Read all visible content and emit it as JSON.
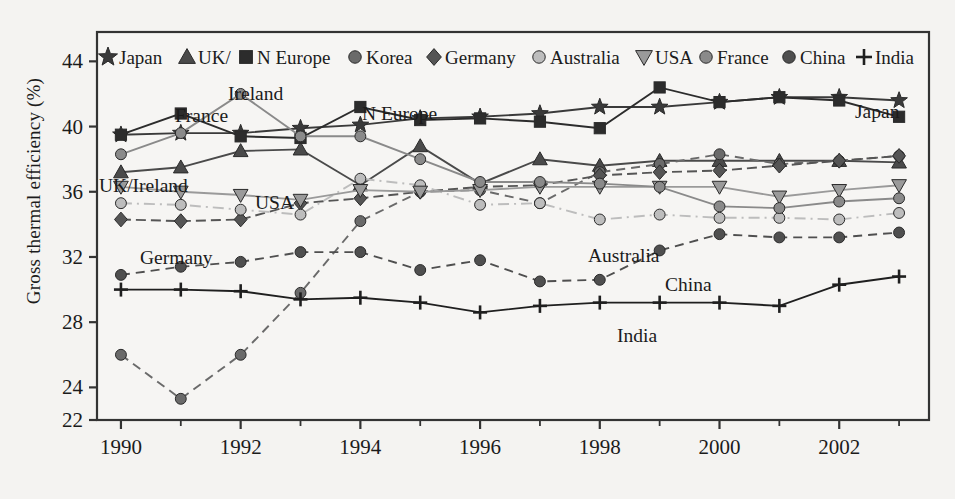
{
  "figure": {
    "background_color": "#f4f3f1",
    "axis_color": "#333333",
    "plot_area": {
      "x": 97,
      "y": 32,
      "width": 832,
      "height": 388
    }
  },
  "chart_data": {
    "type": "line",
    "title": "",
    "xlabel": "",
    "ylabel": "Gross thermal efficiency (%)",
    "x": [
      1990,
      1991,
      1992,
      1993,
      1994,
      1995,
      1996,
      1997,
      1998,
      1999,
      2000,
      2001,
      2002,
      2003
    ],
    "xlim": [
      1989.6,
      2003.5
    ],
    "ylim": [
      22,
      45.8
    ],
    "xticks": [
      1990,
      1992,
      1994,
      1996,
      1998,
      2000,
      2002
    ],
    "xtick_labels": [
      "1990",
      "1992",
      "1994",
      "1996",
      "1998",
      "2000",
      "2002"
    ],
    "xminor_ticks": [
      1991,
      1993,
      1995,
      1997,
      1999,
      2001,
      2003
    ],
    "yticks": [
      22,
      24,
      28,
      32,
      36,
      40,
      44
    ],
    "ytick_labels": [
      "22",
      "24",
      "28",
      "32",
      "36",
      "40",
      "44"
    ],
    "grid": false,
    "legend_position": "top-inside",
    "series": [
      {
        "name": "Japan",
        "marker": "star",
        "color": "#3a3a3a",
        "line_style": "solid",
        "values": [
          39.5,
          39.6,
          39.6,
          39.9,
          40.1,
          40.5,
          40.6,
          40.8,
          41.2,
          41.2,
          41.5,
          41.8,
          41.8,
          41.6
        ]
      },
      {
        "name": "UK/Ireland",
        "marker": "triangle-up",
        "color": "#4a4a4a",
        "line_style": "solid",
        "values": [
          37.2,
          37.5,
          38.5,
          38.6,
          36.4,
          38.8,
          36.5,
          38.0,
          37.6,
          37.9,
          37.9,
          37.9,
          37.9,
          37.8
        ]
      },
      {
        "name": "N Europe",
        "marker": "square",
        "color": "#2c2c2c",
        "line_style": "solid",
        "values": [
          39.5,
          40.8,
          39.4,
          39.3,
          41.2,
          40.4,
          40.5,
          40.3,
          39.9,
          42.4,
          41.5,
          41.8,
          41.6,
          40.6
        ]
      },
      {
        "name": "Korea",
        "marker": "circle",
        "color": "#6a6a6a",
        "line_style": "dashed",
        "values": [
          26.0,
          23.3,
          26.0,
          29.8,
          34.2,
          36.0,
          36.1,
          35.3,
          37.2,
          37.7,
          38.3,
          37.7,
          37.9,
          38.2
        ]
      },
      {
        "name": "Germany",
        "marker": "diamond",
        "color": "#555555",
        "line_style": "dashed-light",
        "values": [
          34.3,
          34.2,
          34.3,
          35.3,
          35.6,
          36.0,
          36.3,
          36.4,
          37.0,
          37.2,
          37.3,
          37.6,
          37.9,
          38.2
        ]
      },
      {
        "name": "Australia",
        "marker": "circle",
        "color": "#bdbdbd",
        "line_style": "dash-dot",
        "values": [
          35.3,
          35.2,
          34.9,
          34.6,
          36.8,
          36.4,
          35.2,
          35.3,
          34.3,
          34.6,
          34.4,
          34.4,
          34.3,
          34.7
        ]
      },
      {
        "name": "USA",
        "marker": "triangle-down",
        "color": "#9a9a9a",
        "line_style": "solid",
        "values": [
          36.3,
          36.0,
          35.8,
          35.5,
          36.1,
          36.0,
          36.1,
          36.3,
          36.3,
          36.3,
          36.3,
          35.7,
          36.1,
          36.4
        ]
      },
      {
        "name": "France",
        "marker": "circle",
        "color": "#8a8a8a",
        "line_style": "solid",
        "values": [
          38.3,
          39.6,
          42.0,
          39.4,
          39.4,
          38.0,
          36.6,
          36.6,
          36.5,
          36.3,
          35.1,
          35.0,
          35.4,
          35.6
        ]
      },
      {
        "name": "China",
        "marker": "circle",
        "color": "#4f4f4f",
        "line_style": "dashed",
        "values": [
          30.9,
          31.4,
          31.7,
          32.3,
          32.3,
          31.2,
          31.8,
          30.5,
          30.6,
          32.4,
          33.4,
          33.2,
          33.2,
          33.5
        ]
      },
      {
        "name": "India",
        "marker": "plus",
        "color": "#1f1f1f",
        "line_style": "solid",
        "values": [
          30.0,
          30.0,
          29.9,
          29.4,
          29.5,
          29.2,
          28.6,
          29.0,
          29.2,
          29.2,
          29.2,
          29.0,
          30.3,
          30.8
        ]
      }
    ],
    "annotations": [
      {
        "text": "Ireland",
        "x": 228,
        "y": 100
      },
      {
        "text": "France",
        "x": 175,
        "y": 122
      },
      {
        "text": "N Europe",
        "x": 362,
        "y": 120
      },
      {
        "text": "Japan",
        "x": 855,
        "y": 118
      },
      {
        "text": "UK/Ireland",
        "x": 99,
        "y": 192
      },
      {
        "text": "USA",
        "x": 255,
        "y": 209
      },
      {
        "text": "Germany",
        "x": 140,
        "y": 264
      },
      {
        "text": "Australia",
        "x": 588,
        "y": 262
      },
      {
        "text": "China",
        "x": 665,
        "y": 291
      },
      {
        "text": "India",
        "x": 617,
        "y": 342
      }
    ],
    "legend": [
      {
        "label": "Japan",
        "marker": "star",
        "color": "#3a3a3a"
      },
      {
        "label": "UK/",
        "marker": "triangle-up",
        "color": "#4a4a4a"
      },
      {
        "label": "N Europe",
        "marker": "square",
        "color": "#2c2c2c"
      },
      {
        "label": "Korea",
        "marker": "circle",
        "color": "#6a6a6a"
      },
      {
        "label": "Germany",
        "marker": "diamond",
        "color": "#555555"
      },
      {
        "label": "Australia",
        "marker": "circle",
        "color": "#bdbdbd"
      },
      {
        "label": "USA",
        "marker": "triangle-down",
        "color": "#9a9a9a"
      },
      {
        "label": "France",
        "marker": "circle",
        "color": "#8a8a8a"
      },
      {
        "label": "China",
        "marker": "circle",
        "color": "#4f4f4f"
      },
      {
        "label": "India",
        "marker": "plus",
        "color": "#1f1f1f"
      }
    ]
  }
}
